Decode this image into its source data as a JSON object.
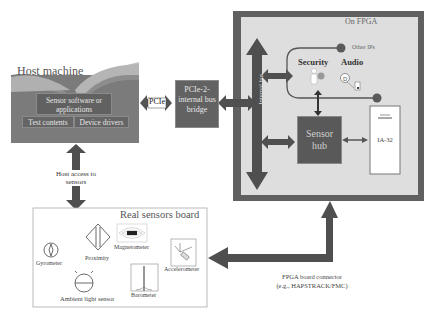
{
  "host_machine": {
    "title": "Host machine",
    "software_box": "Sensor software or applications",
    "test_box": "Test contents",
    "drivers_box": "Device drivers"
  },
  "pcie_link": {
    "label": "PCIe"
  },
  "bridge": {
    "label": "PCIe-2-internal bus bridge"
  },
  "fpga": {
    "title": "On FPGA",
    "internal_bus": "Internal bus",
    "other_ips": "Other IPs",
    "security": "Security",
    "audio": "Audio",
    "sensor_hub": "Sensor hub",
    "ia32": "IA-32"
  },
  "host_access": {
    "label_line1": "Host access to",
    "label_line2": "sensors"
  },
  "sensors_board": {
    "title": "Real sensors board",
    "sensors": [
      {
        "name": "Gyrometer",
        "icon": "gyrometer-icon"
      },
      {
        "name": "Proximity",
        "icon": "proximity-icon"
      },
      {
        "name": "Magnetometer",
        "icon": "magnetometer-icon"
      },
      {
        "name": "Accelerometer",
        "icon": "accelerometer-icon"
      },
      {
        "name": "Ambient light sensor",
        "icon": "ambient-light-icon"
      },
      {
        "name": "Barometer",
        "icon": "barometer-icon"
      }
    ]
  },
  "connector": {
    "label_line1": "FPGA board connector",
    "label_line2": "(e.g., HAPSTRACK/FMC)"
  },
  "colors": {
    "dark_arrow": "#4d4d4d",
    "fpga_border": "#606060",
    "fpga_fill": "#dcdcdc",
    "box_fill": "#5c5c5c",
    "host_fill": "#7a7a7a"
  }
}
